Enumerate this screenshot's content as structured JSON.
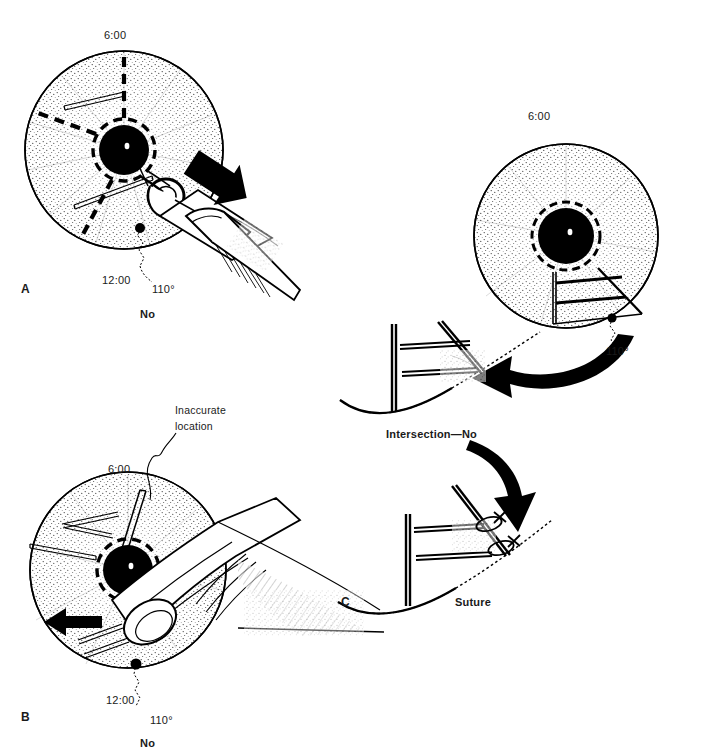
{
  "figure": {
    "background_color": "#ffffff",
    "ink_color": "#000000"
  },
  "panels": [
    {
      "id": "A",
      "letter": "A",
      "verdict": "No",
      "labels": {
        "top_clock": "6:00",
        "bottom_clock": "12:00",
        "angle": "110°"
      }
    },
    {
      "id": "B",
      "letter": "B",
      "verdict": "No",
      "callout": "Inaccurate\nlocation",
      "callout_line1": "Inaccurate",
      "callout_line2": "location",
      "labels": {
        "top_clock": "6:00",
        "bottom_clock": "12:00",
        "angle": "110°"
      }
    },
    {
      "id": "C",
      "letter": "C",
      "labels": {
        "top_clock": "6:00",
        "angle": "110°",
        "step_one": "Intersection—No",
        "step_two": "Suture"
      }
    }
  ],
  "icons": {
    "straight_arrow": "arrow-icon",
    "curved_arrow": "curved-arrow-icon",
    "suture_knot": "suture-knot-icon",
    "instrument": "surgical-instrument-icon",
    "cornea_disc": "cornea-disc-icon"
  }
}
